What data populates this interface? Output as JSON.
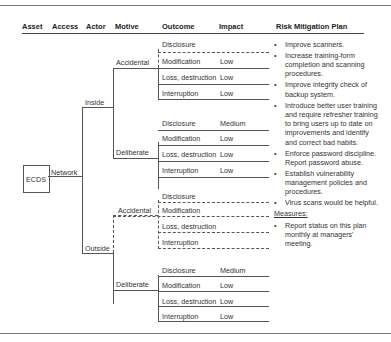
{
  "headers": {
    "asset": "Asset",
    "access": "Access",
    "actor": "Actor",
    "motive": "Motive",
    "outcome": "Outcome",
    "impact": "Impact",
    "plan": "Risk Mitigation Plan"
  },
  "asset": "ECDS",
  "access": "Network",
  "actors": [
    {
      "label": "Inside",
      "motives": [
        {
          "label": "Accidental",
          "outcomes": [
            {
              "outcome": "Disclosure",
              "impact": ""
            },
            {
              "outcome": "Modification",
              "impact": "Low"
            },
            {
              "outcome": "Loss, destruction",
              "impact": "Low"
            },
            {
              "outcome": "Interruption",
              "impact": "Low"
            }
          ]
        },
        {
          "label": "Deliberate",
          "outcomes": [
            {
              "outcome": "Disclosure",
              "impact": "Medium"
            },
            {
              "outcome": "Modification",
              "impact": "Low"
            },
            {
              "outcome": "Loss, destruction",
              "impact": "Low"
            },
            {
              "outcome": "Interruption",
              "impact": "Low"
            }
          ]
        }
      ]
    },
    {
      "label": "Outside",
      "motives": [
        {
          "label": "Accidental",
          "outcomes": [
            {
              "outcome": "Disclosure",
              "impact": ""
            },
            {
              "outcome": "Modification",
              "impact": ""
            },
            {
              "outcome": "Loss, destruction",
              "impact": ""
            },
            {
              "outcome": "Interruption",
              "impact": ""
            }
          ]
        },
        {
          "label": "Deliberate",
          "outcomes": [
            {
              "outcome": "Disclosure",
              "impact": "Medium"
            },
            {
              "outcome": "Modification",
              "impact": "Low"
            },
            {
              "outcome": "Loss, destruction",
              "impact": "Low"
            },
            {
              "outcome": "Interruption",
              "impact": "Low"
            }
          ]
        }
      ]
    }
  ],
  "plan": {
    "bullet": "•",
    "items": [
      "Improve scanners.",
      "Increase training-form completion and scanning procedures.",
      "Improve integrity check of backup system.",
      "Introduce better user training and require refresher training to bring users up to date on improvements and identify and correct bad habits.",
      "Enforce password discipline. Report password abuse.",
      "Establish vulnerability management policies and procedures.",
      "Virus scans would be helpful."
    ],
    "measures_label": "Measures:",
    "measures": [
      "Report status on this plan monthly at managers' meeting."
    ]
  }
}
